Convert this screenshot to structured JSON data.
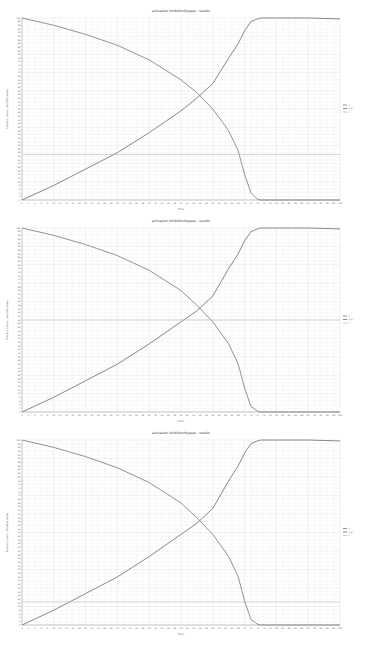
{
  "charts": [
    {
      "title": "activation inhibition/bypass - results",
      "xlabel": "Time",
      "ylabel": "Process Count / Variable Value",
      "legend": [
        "x",
        "x_e",
        "t"
      ],
      "hline_frac": 0.25
    },
    {
      "title": "activation inhibition/bypass - results",
      "xlabel": "Time",
      "ylabel": "Process Count / Variable Value",
      "legend": [
        "x",
        "x_e",
        "t"
      ],
      "hline_frac": 0.5
    },
    {
      "title": "activation inhibition/bypass - results",
      "xlabel": "Time",
      "ylabel": "Process Count / Variable Value",
      "legend": [
        "x",
        "x_e",
        "t"
      ],
      "hline_frac": 0.125
    }
  ],
  "chart_data": [
    {
      "type": "line",
      "title": "activation inhibition/bypass - results",
      "xlabel": "Time",
      "ylabel": "Process Count / Variable Value",
      "ylim": [
        0,
        100
      ],
      "xlim": [
        0,
        100
      ],
      "grid": true,
      "legend_position": "right",
      "x": [
        0,
        10,
        20,
        30,
        40,
        50,
        55,
        60,
        65,
        68,
        70,
        72,
        74,
        75,
        80,
        90,
        100
      ],
      "series": [
        {
          "name": "x (decreasing)",
          "values": [
            100,
            96,
            91,
            85,
            77,
            66,
            59,
            50,
            38,
            27,
            14,
            4,
            0.5,
            0,
            0,
            0,
            0
          ]
        },
        {
          "name": "x_e (increasing)",
          "values": [
            0,
            8,
            17,
            26,
            37,
            49,
            56,
            64,
            78,
            86,
            93,
            98,
            99.5,
            100,
            100,
            100,
            99.5
          ]
        },
        {
          "name": "t (constant)",
          "values": [
            25,
            25,
            25,
            25,
            25,
            25,
            25,
            25,
            25,
            25,
            25,
            25,
            25,
            25,
            25,
            25,
            25
          ]
        }
      ]
    },
    {
      "type": "line",
      "title": "activation inhibition/bypass - results",
      "xlabel": "Time",
      "ylabel": "Process Count / Variable Value",
      "ylim": [
        0,
        100
      ],
      "xlim": [
        0,
        100
      ],
      "grid": true,
      "legend_position": "right",
      "x": [
        0,
        10,
        20,
        30,
        40,
        50,
        55,
        60,
        65,
        68,
        70,
        72,
        74,
        75,
        80,
        90,
        100
      ],
      "series": [
        {
          "name": "x (decreasing)",
          "values": [
            100,
            96,
            91,
            85,
            77,
            66,
            58,
            49,
            37,
            26,
            13,
            3,
            0.5,
            0,
            0,
            0,
            0
          ]
        },
        {
          "name": "x_e (increasing)",
          "values": [
            0,
            8,
            17,
            26,
            37,
            49,
            55,
            63,
            78,
            86,
            93,
            98,
            99.5,
            100,
            100,
            100,
            99.5
          ]
        },
        {
          "name": "t (constant)",
          "values": [
            50,
            50,
            50,
            50,
            50,
            50,
            50,
            50,
            50,
            50,
            50,
            50,
            50,
            50,
            50,
            50,
            50
          ]
        }
      ]
    },
    {
      "type": "line",
      "title": "activation inhibition/bypass - results",
      "xlabel": "Time",
      "ylabel": "Process Count / Variable Value",
      "ylim": [
        0,
        100
      ],
      "xlim": [
        0,
        100
      ],
      "grid": true,
      "legend_position": "right",
      "x": [
        0,
        10,
        20,
        30,
        40,
        50,
        55,
        60,
        65,
        68,
        70,
        72,
        74,
        75,
        80,
        90,
        100
      ],
      "series": [
        {
          "name": "x (decreasing)",
          "values": [
            100,
            96,
            91,
            85,
            77,
            66,
            58,
            49,
            37,
            26,
            13,
            3,
            0.5,
            0,
            0,
            0,
            0
          ]
        },
        {
          "name": "x_e (increasing)",
          "values": [
            0,
            8,
            17,
            26,
            37,
            49,
            55,
            63,
            78,
            86,
            93,
            98,
            99.5,
            100,
            100,
            100,
            99.5
          ]
        },
        {
          "name": "t (constant)",
          "values": [
            12.5,
            12.5,
            12.5,
            12.5,
            12.5,
            12.5,
            12.5,
            12.5,
            12.5,
            12.5,
            12.5,
            12.5,
            12.5,
            12.5,
            12.5,
            12.5,
            12.5
          ]
        }
      ]
    }
  ]
}
